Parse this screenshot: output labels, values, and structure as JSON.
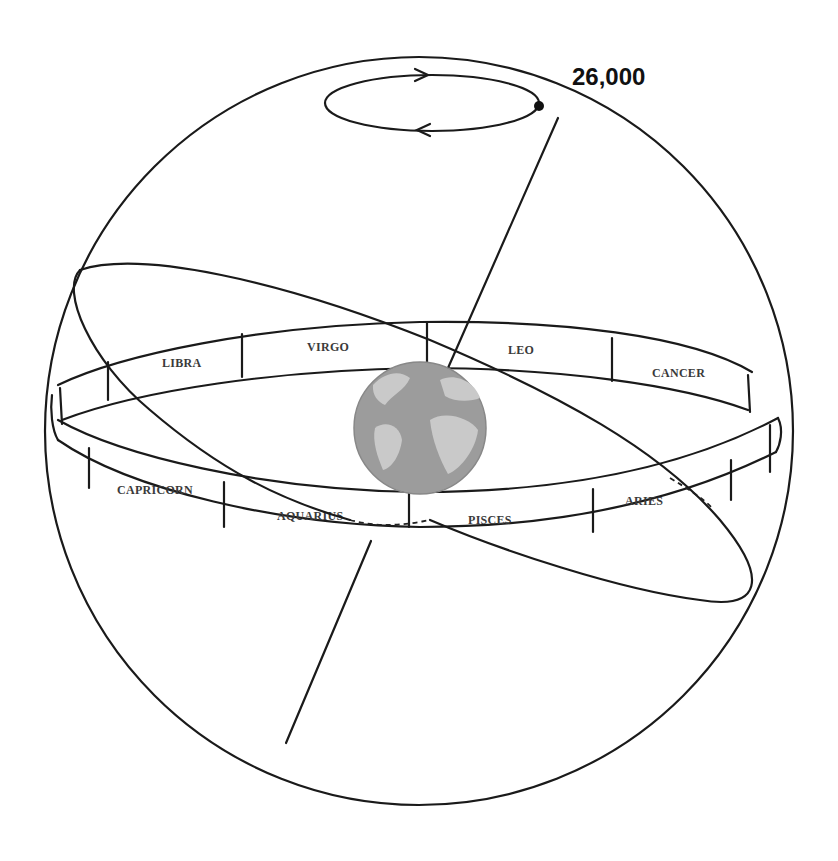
{
  "diagram": {
    "title_label": "26,000",
    "central_body": "earth",
    "zodiac_band": {
      "back_signs": [
        "LIBRA",
        "VIRGO",
        "LEO",
        "CANCER"
      ],
      "front_signs": [
        "CAPRICORN",
        "AQUARIUS",
        "PISCES",
        "ARIES"
      ]
    },
    "elements": {
      "celestial_sphere": "outer-circle",
      "ecliptic": "tilted-ellipse",
      "precession_orbit": "small-ellipse-with-arrows",
      "axis": "earth-rotation-axis"
    },
    "colors": {
      "line": "#1a1a1a",
      "earth_ocean": "#9a9a9a",
      "earth_land": "#c8c8c8",
      "background": "#ffffff"
    }
  }
}
